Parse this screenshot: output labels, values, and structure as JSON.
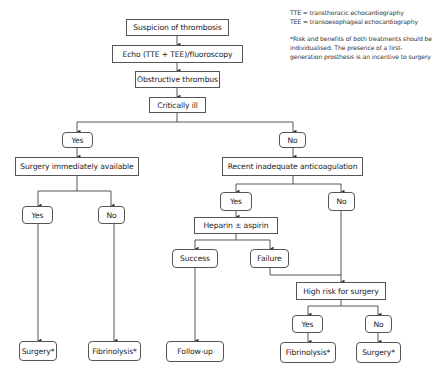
{
  "legend": {
    "abbreviations": [
      "TTE = transthoracic echocardiography",
      "TEE = transoesophageal echocardiography"
    ],
    "footnote": "*Risk and benefits of both treatments should be individualised. The presence of a first-generation prosthesis is an incentive to surgery"
  },
  "flowchart": {
    "nodes": {
      "suspicion": "Suspicion of thrombosis",
      "echo": "Echo (TTE + TEE)/fluoroscopy",
      "obstructive": "Obstructive thrombus",
      "critically_ill": "Critically ill",
      "ci_yes": "Yes",
      "ci_no": "No",
      "surgery_available": "Surgery immediately available",
      "sa_yes": "Yes",
      "sa_no": "No",
      "sa_yes_outcome": "Surgery*",
      "sa_no_outcome": "Fibrinolysis*",
      "recent_anticoag": "Recent inadequate anticoagulation",
      "ra_yes": "Yes",
      "ra_no": "No",
      "heparin": "Heparin ± aspirin",
      "success": "Success",
      "failure": "Failure",
      "follow_up": "Follow-up",
      "high_risk": "High risk for surgery",
      "hr_yes": "Yes",
      "hr_no": "No",
      "hr_yes_outcome": "Fibrinolysis*",
      "hr_no_outcome": "Surgery*"
    },
    "colors": {
      "line": "#444444",
      "border": "#555555",
      "text": "#222222"
    }
  }
}
